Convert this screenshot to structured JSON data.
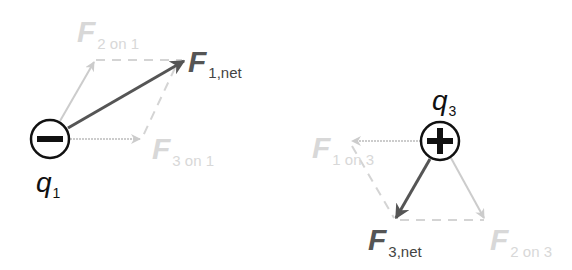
{
  "diagram": {
    "colors": {
      "component_force": "#cccccc",
      "net_force": "#555555",
      "charge_outline": "#111111",
      "background": "#ffffff"
    },
    "charges": [
      {
        "id": "q1",
        "label_main": "q",
        "label_sub": "1",
        "sign": "negative",
        "symbol": "minus-icon"
      },
      {
        "id": "q3",
        "label_main": "q",
        "label_sub": "3",
        "sign": "positive",
        "symbol": "plus-icon"
      }
    ],
    "forces": {
      "f_2_on_1": {
        "main": "F",
        "sub": "2 on 1",
        "kind": "component"
      },
      "f_3_on_1": {
        "main": "F",
        "sub": "3 on 1",
        "kind": "component"
      },
      "f_1_net": {
        "main": "F",
        "sub": "1,net",
        "kind": "net"
      },
      "f_1_on_3": {
        "main": "F",
        "sub": "1 on 3",
        "kind": "component"
      },
      "f_2_on_3": {
        "main": "F",
        "sub": "2 on 3",
        "kind": "component"
      },
      "f_3_net": {
        "main": "F",
        "sub": "3,net",
        "kind": "net"
      }
    }
  }
}
